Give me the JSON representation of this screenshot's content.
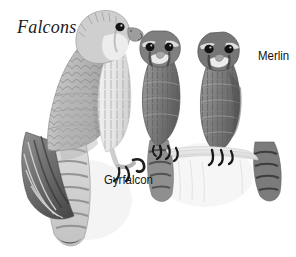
{
  "plate": {
    "title": "Falcons",
    "background_color": "#ffffff",
    "ink_color": "#141414",
    "style": "grayscale field-guide illustration"
  },
  "labels": {
    "gyrfalcon": "Gyrfalcon",
    "merlin": "Merlin"
  },
  "subjects": [
    {
      "name": "Gyrfalcon",
      "count": 1,
      "position": "left",
      "pose": "perched, facing right",
      "notes": "large pale grey falcon with scalloped wing coverts, streaked white breast, long barred tail, yellow-grey feet with black talons"
    },
    {
      "name": "Merlin",
      "count": 2,
      "position": "right",
      "pose": "two perched birds facing forward",
      "notes": "small dark falcons with bold facial masks, pale supercilium, streaked underparts, barred tails"
    }
  ]
}
